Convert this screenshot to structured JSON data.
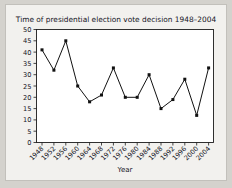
{
  "chart_data": {
    "type": "line",
    "title": "Time of presidential election vote decision 1948–2004",
    "xlabel": "Year",
    "ylabel": "",
    "categories": [
      "1948",
      "1952",
      "1956",
      "1960",
      "1964",
      "1968",
      "1972",
      "1976",
      "1980",
      "1984",
      "1988",
      "1992",
      "1996",
      "2000",
      "2004"
    ],
    "values": [
      41,
      32,
      45,
      25,
      18,
      21,
      33,
      20,
      20,
      30,
      15,
      19,
      28,
      12,
      33
    ],
    "ylim": [
      0,
      50
    ],
    "yticks": [
      0,
      5,
      10,
      15,
      20,
      25,
      30,
      35,
      40,
      45,
      50
    ],
    "ytick_labels": [
      "0",
      "5",
      "10",
      "15",
      "20",
      "25",
      "30",
      "35",
      "40",
      "45",
      "50"
    ],
    "grid": false,
    "legend": false,
    "marker": "filled-square",
    "line_color": "#111111",
    "marker_color": "#111111",
    "plot_background": "#ffffff",
    "figure_background": "#f2f1ee",
    "page_background": "#d4d2cd",
    "xtick_rotation": -45
  }
}
